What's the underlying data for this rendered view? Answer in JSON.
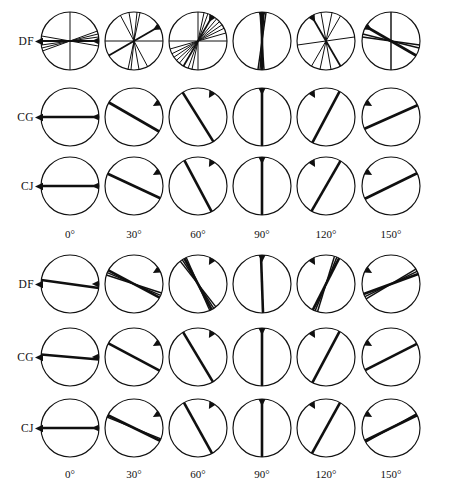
{
  "figure": {
    "type": "orientation-diagram-grid",
    "panels": 2,
    "columns": 6,
    "rows_per_panel": 3
  },
  "column_labels": [
    "0°",
    "30°",
    "60°",
    "90°",
    "120°",
    "150°"
  ],
  "row_labels": [
    "DF",
    "CG",
    "CJ"
  ],
  "colors": {
    "ink": "#101010",
    "circle_stroke": "#101010",
    "background": "#ffffff"
  },
  "geometry": {
    "radius": 29,
    "col_centers": [
      70,
      134,
      198,
      262,
      326,
      391
    ],
    "panel_top_row_centers": [
      41,
      117,
      186
    ],
    "panel_bottom_row_centers": [
      284,
      357,
      428
    ],
    "col_label_y_top": 228,
    "col_label_y_bottom": 468
  },
  "chart_data": {
    "type": "line",
    "title": "",
    "xlabel": "",
    "ylabel": "",
    "panels": [
      {
        "name": "panel-top",
        "rows": [
          {
            "label": "DF",
            "cells": [
              {
                "target": 0,
                "lines": [
                  0,
                  90,
                  8,
                  14,
                  20,
                  170
                ]
              },
              {
                "target": 30,
                "lines": [
                  30,
                  78,
                  84,
                  100,
                  0,
                  118
                ]
              },
              {
                "target": 60,
                "lines": [
                  60,
                  90,
                  70,
                  78,
                  50,
                  42,
                  34,
                  26,
                  16,
                  0
                ]
              },
              {
                "target": 90,
                "lines": [
                  90,
                  86,
                  94,
                  82
                ]
              },
              {
                "target": 120,
                "lines": [
                  120,
                  100,
                  78,
                  60,
                  8
                ]
              },
              {
                "target": 150,
                "lines": [
                  150,
                  172,
                  90,
                  166
                ]
              }
            ]
          },
          {
            "label": "CG",
            "cells": [
              {
                "target": 0,
                "lines": [
                  0
                ]
              },
              {
                "target": 30,
                "lines": [
                  150
                ]
              },
              {
                "target": 60,
                "lines": [
                  122
                ]
              },
              {
                "target": 90,
                "lines": [
                  90
                ]
              },
              {
                "target": 120,
                "lines": [
                  62
                ]
              },
              {
                "target": 150,
                "lines": [
                  24
                ]
              }
            ]
          },
          {
            "label": "CJ",
            "cells": [
              {
                "target": 0,
                "lines": [
                  0
                ]
              },
              {
                "target": 30,
                "lines": [
                  155
                ]
              },
              {
                "target": 60,
                "lines": [
                  118
                ]
              },
              {
                "target": 90,
                "lines": [
                  90
                ]
              },
              {
                "target": 120,
                "lines": [
                  60
                ]
              },
              {
                "target": 150,
                "lines": [
                  26
                ]
              }
            ]
          }
        ]
      },
      {
        "name": "panel-bottom",
        "rows": [
          {
            "label": "DF",
            "cells": [
              {
                "target": 0,
                "lines": [
                  172
                ]
              },
              {
                "target": 30,
                "lines": [
                  152,
                  157,
                  162
                ]
              },
              {
                "target": 60,
                "lines": [
                  118,
                  123,
                  128,
                  114
                ]
              },
              {
                "target": 90,
                "lines": [
                  92
                ]
              },
              {
                "target": 120,
                "lines": [
                  63,
                  68,
                  73
                ]
              },
              {
                "target": 150,
                "lines": [
                  20,
                  26,
                  31
                ]
              }
            ]
          },
          {
            "label": "CG",
            "cells": [
              {
                "target": 0,
                "lines": [
                  175
                ]
              },
              {
                "target": 30,
                "lines": [
                  152
                ]
              },
              {
                "target": 60,
                "lines": [
                  121
                ]
              },
              {
                "target": 90,
                "lines": [
                  90
                ]
              },
              {
                "target": 120,
                "lines": [
                  62
                ]
              },
              {
                "target": 150,
                "lines": [
                  27
                ]
              }
            ]
          },
          {
            "label": "CJ",
            "cells": [
              {
                "target": 0,
                "lines": [
                  0
                ]
              },
              {
                "target": 30,
                "lines": [
                  154,
                  158
                ]
              },
              {
                "target": 60,
                "lines": [
                  119
                ]
              },
              {
                "target": 90,
                "lines": [
                  90
                ]
              },
              {
                "target": 120,
                "lines": [
                  61
                ]
              },
              {
                "target": 150,
                "lines": [
                  26,
                  29
                ]
              }
            ]
          }
        ]
      }
    ]
  }
}
